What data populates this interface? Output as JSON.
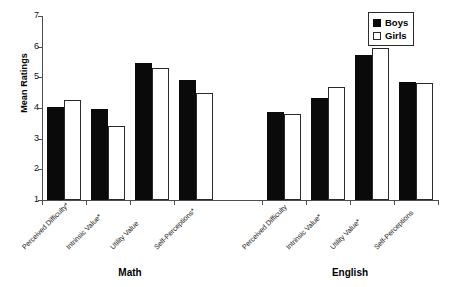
{
  "chart_data": {
    "type": "bar",
    "title": "",
    "xlabel": "",
    "ylabel": "Mean Ratings",
    "ylim": [
      1,
      7
    ],
    "yticks": [
      "1",
      "2",
      "3",
      "4",
      "5",
      "6",
      "7"
    ],
    "grid": false,
    "legend_position": "top-right",
    "groups": [
      "Math",
      "English"
    ],
    "categories": [
      "Perceived Difficulty*",
      "Intrinsic Value*",
      "Utility Value",
      "Self-Perceptions*",
      "Perceived Difficulty",
      "Intrinsic Value*",
      "Utility Value*",
      "Self-Perceptions"
    ],
    "series": [
      {
        "name": "Boys",
        "color": "#0a0a0a",
        "values": [
          4.03,
          3.97,
          5.47,
          4.9,
          3.88,
          4.34,
          5.72,
          4.85
        ]
      },
      {
        "name": "Girls",
        "color": "#ffffff",
        "values": [
          4.25,
          3.4,
          5.3,
          4.48,
          3.79,
          4.67,
          5.95,
          4.8
        ]
      }
    ]
  },
  "axis": {
    "y_title": "Mean Ratings"
  },
  "legend": {
    "items": [
      {
        "label": "Boys",
        "swatch": "boys"
      },
      {
        "label": "Girls",
        "swatch": "girls"
      }
    ]
  },
  "groups": [
    {
      "label": "Math"
    },
    {
      "label": "English"
    }
  ]
}
